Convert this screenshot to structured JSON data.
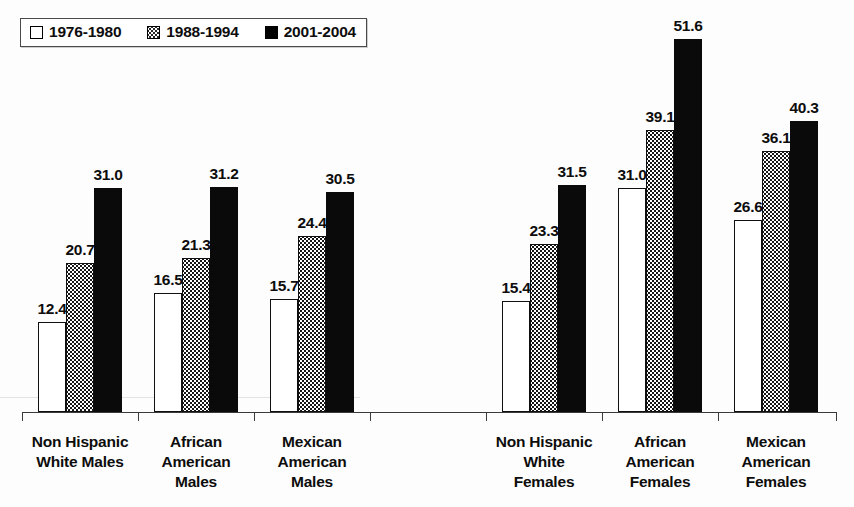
{
  "legend": {
    "position": "top-left",
    "items": [
      {
        "label": "1976-1980",
        "swatch": "white-square-icon",
        "fill": "#ffffff"
      },
      {
        "label": "1988-1994",
        "swatch": "dotted-square-icon",
        "fill": "#ffffff"
      },
      {
        "label": "2001-2004",
        "swatch": "black-square-icon",
        "fill": "#000000"
      }
    ]
  },
  "chart_data": {
    "type": "bar",
    "title": "",
    "subtitle": "",
    "xlabel": "",
    "ylabel": "",
    "ylim": [
      0,
      55
    ],
    "grid": false,
    "legend_position": "top-left",
    "categories": [
      "Non Hispanic White Males",
      "African American Males",
      "Mexican American Males",
      "Non Hispanic White Females",
      "African American Females",
      "Mexican American Females"
    ],
    "category_lines": [
      [
        "Non Hispanic",
        "White Males"
      ],
      [
        "African",
        "American",
        "Males"
      ],
      [
        "Mexican",
        "American",
        "Males"
      ],
      [
        "Non Hispanic",
        "White",
        "Females"
      ],
      [
        "African",
        "American",
        "Females"
      ],
      [
        "Mexican",
        "American",
        "Females"
      ]
    ],
    "series": [
      {
        "name": "1976-1980",
        "values": [
          12.4,
          16.5,
          15.7,
          15.4,
          31.0,
          26.6
        ]
      },
      {
        "name": "1988-1994",
        "values": [
          20.7,
          21.3,
          24.4,
          23.3,
          39.1,
          36.1
        ]
      },
      {
        "name": "2001-2004",
        "values": [
          31.0,
          31.2,
          30.5,
          31.5,
          51.6,
          40.3
        ]
      }
    ],
    "data_labels": [
      [
        "12.4",
        "20.7",
        "31.0"
      ],
      [
        "16.5",
        "21.3",
        "31.2"
      ],
      [
        "15.7",
        "24.4",
        "30.5"
      ],
      [
        "15.4",
        "23.3",
        "31.5"
      ],
      [
        "31.0",
        "39.1",
        "51.6"
      ],
      [
        "26.6",
        "36.1",
        "40.3"
      ]
    ]
  }
}
